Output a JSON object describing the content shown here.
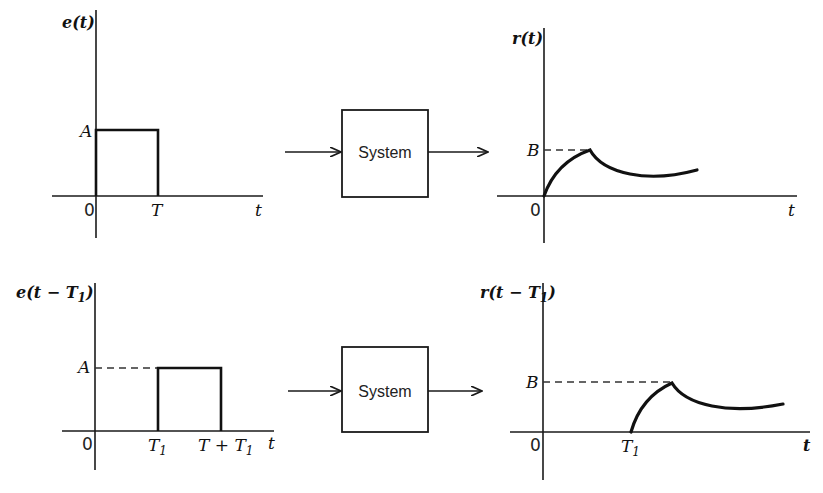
{
  "diagram": {
    "title": "",
    "top_row": {
      "input_plot": {
        "y_label": "e(t)",
        "x_label": "t",
        "origin_label": "0",
        "amplitude_label": "A",
        "pulse_end_label": "T"
      },
      "system_block": {
        "label": "System"
      },
      "output_plot": {
        "y_label": "r(t)",
        "x_label": "t",
        "origin_label": "0",
        "peak_label": "B"
      }
    },
    "bottom_row": {
      "input_plot": {
        "y_label_prefix": "e(t − T",
        "y_label_sub": "1",
        "y_label_suffix": ")",
        "x_label": "t",
        "origin_label": "0",
        "amplitude_label": "A",
        "pulse_start_label": "T",
        "pulse_start_sub": "1",
        "pulse_end_label": "T + T",
        "pulse_end_sub": "1"
      },
      "system_block": {
        "label": "System"
      },
      "output_plot": {
        "y_label_prefix": "r(t − T",
        "y_label_sub": "1",
        "y_label_suffix": ")",
        "x_label": "t",
        "origin_label": "0",
        "peak_label": "B",
        "shift_label": "T",
        "shift_sub": "1"
      }
    }
  }
}
